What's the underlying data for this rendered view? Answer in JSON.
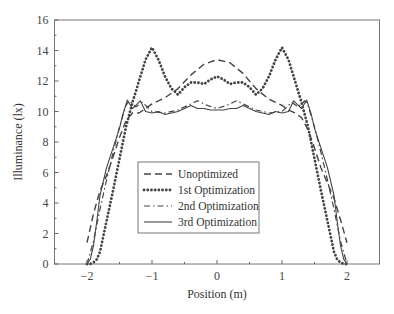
{
  "chart_data": {
    "type": "line",
    "title": "",
    "xlabel": "Position (m)",
    "ylabel": "Illuminance (lx)",
    "xlim": [
      -2.5,
      2.5
    ],
    "ylim": [
      0,
      16
    ],
    "xticks": [
      -2,
      -1,
      0,
      1,
      2
    ],
    "xtick_labels": [
      "−2",
      "−1",
      "0",
      "1",
      "2"
    ],
    "yticks": [
      0,
      2,
      4,
      6,
      8,
      10,
      12,
      14,
      16
    ],
    "ytick_labels": [
      "0",
      "2",
      "4",
      "6",
      "8",
      "10",
      "12",
      "14",
      "16"
    ],
    "grid": false,
    "legend_position": "lower center",
    "series": [
      {
        "name": "Unoptimized",
        "style": "dashed",
        "x": [
          -2.0,
          -1.9,
          -1.8,
          -1.7,
          -1.6,
          -1.5,
          -1.4,
          -1.3,
          -1.2,
          -1.1,
          -1.0,
          -0.8,
          -0.6,
          -0.4,
          -0.2,
          0.0,
          0.2,
          0.4,
          0.6,
          0.8,
          1.0,
          1.1,
          1.2,
          1.3,
          1.4,
          1.5,
          1.6,
          1.7,
          1.8,
          1.9,
          2.0
        ],
        "y": [
          1.4,
          3.3,
          4.8,
          5.8,
          7.0,
          8.3,
          9.4,
          9.9,
          9.9,
          10.2,
          10.5,
          10.9,
          11.5,
          12.4,
          13.1,
          13.4,
          13.2,
          12.5,
          11.5,
          10.8,
          10.4,
          10.1,
          9.9,
          9.6,
          8.8,
          7.6,
          6.3,
          5.3,
          4.3,
          2.9,
          1.4
        ]
      },
      {
        "name": "1st Optimization",
        "style": "dotted",
        "x": [
          -2.0,
          -1.95,
          -1.9,
          -1.85,
          -1.8,
          -1.7,
          -1.6,
          -1.5,
          -1.4,
          -1.3,
          -1.2,
          -1.1,
          -1.0,
          -0.9,
          -0.8,
          -0.7,
          -0.6,
          -0.5,
          -0.4,
          -0.3,
          -0.2,
          -0.1,
          0.0,
          0.1,
          0.2,
          0.3,
          0.4,
          0.5,
          0.6,
          0.7,
          0.8,
          0.9,
          1.0,
          1.1,
          1.2,
          1.3,
          1.4,
          1.5,
          1.6,
          1.7,
          1.8,
          1.85,
          1.9,
          1.95,
          2.0
        ],
        "y": [
          0.0,
          0.0,
          0.1,
          0.3,
          0.8,
          2.8,
          4.8,
          6.9,
          9.0,
          10.6,
          12.0,
          13.4,
          14.2,
          13.4,
          12.3,
          11.5,
          11.1,
          11.6,
          11.9,
          11.9,
          11.8,
          12.1,
          12.3,
          12.1,
          11.8,
          11.9,
          11.9,
          11.6,
          11.1,
          11.5,
          12.3,
          13.4,
          14.2,
          13.4,
          12.0,
          10.6,
          9.0,
          6.9,
          4.8,
          2.8,
          0.8,
          0.3,
          0.1,
          0.0,
          0.0
        ]
      },
      {
        "name": "2nd Optimization",
        "style": "dash-dot",
        "x": [
          -2.0,
          -1.9,
          -1.8,
          -1.7,
          -1.6,
          -1.5,
          -1.4,
          -1.35,
          -1.25,
          -1.15,
          -1.0,
          -0.8,
          -0.6,
          -0.4,
          -0.3,
          -0.15,
          0.0,
          0.15,
          0.3,
          0.4,
          0.6,
          0.8,
          1.0,
          1.15,
          1.25,
          1.35,
          1.4,
          1.5,
          1.6,
          1.7,
          1.8,
          1.9,
          2.0
        ],
        "y": [
          0.0,
          1.5,
          3.6,
          5.5,
          7.3,
          9.0,
          10.4,
          10.7,
          10.3,
          10.6,
          10.0,
          9.9,
          10.1,
          10.5,
          10.7,
          10.4,
          10.2,
          10.4,
          10.7,
          10.5,
          10.1,
          9.9,
          10.0,
          10.6,
          10.3,
          10.7,
          10.4,
          9.0,
          7.3,
          5.5,
          3.6,
          1.5,
          0.0
        ]
      },
      {
        "name": "3rd Optimization",
        "style": "solid",
        "x": [
          -2.0,
          -1.95,
          -1.9,
          -1.85,
          -1.8,
          -1.7,
          -1.6,
          -1.5,
          -1.45,
          -1.38,
          -1.3,
          -1.25,
          -1.18,
          -1.1,
          -1.0,
          -0.9,
          -0.8,
          -0.7,
          -0.6,
          -0.5,
          -0.4,
          -0.3,
          -0.2,
          -0.1,
          0.0,
          0.1,
          0.2,
          0.3,
          0.4,
          0.5,
          0.6,
          0.7,
          0.8,
          0.9,
          1.0,
          1.1,
          1.18,
          1.25,
          1.3,
          1.38,
          1.45,
          1.5,
          1.6,
          1.7,
          1.8,
          1.85,
          1.9,
          1.95,
          2.0
        ],
        "y": [
          0.0,
          0.3,
          1.2,
          2.8,
          4.5,
          6.3,
          7.6,
          8.9,
          9.8,
          10.75,
          10.2,
          10.4,
          10.7,
          10.0,
          9.9,
          10.0,
          9.8,
          9.9,
          10.0,
          10.2,
          10.4,
          10.2,
          10.2,
          10.1,
          10.1,
          10.1,
          10.2,
          10.2,
          10.4,
          10.2,
          10.0,
          9.9,
          9.8,
          10.0,
          9.9,
          10.0,
          10.7,
          10.4,
          10.2,
          10.75,
          9.8,
          8.9,
          7.6,
          6.3,
          4.5,
          2.8,
          1.2,
          0.3,
          0.0
        ]
      }
    ]
  }
}
